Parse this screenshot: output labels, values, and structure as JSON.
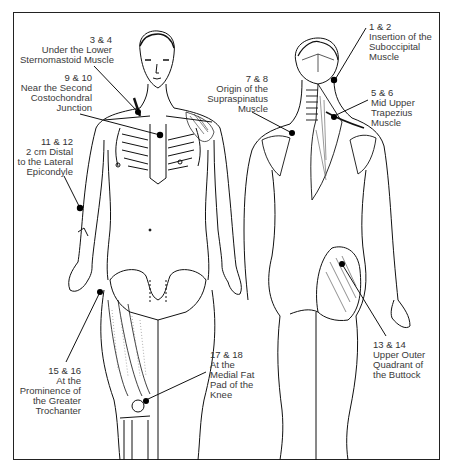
{
  "diagram": {
    "type": "anatomical-tender-points",
    "views": [
      "anterior",
      "posterior"
    ],
    "labels": [
      {
        "id": "p3-4",
        "numbers": "3 & 4",
        "lines": [
          "Under the Lower",
          "Sternomastoid Muscle"
        ]
      },
      {
        "id": "p9-10",
        "numbers": "9 & 10",
        "lines": [
          "Near the Second",
          "Costochondral",
          "Junction"
        ]
      },
      {
        "id": "p11-12",
        "numbers": "11 & 12",
        "lines": [
          "2 cm  Distal",
          "to the Lateral",
          "Epicondyle"
        ]
      },
      {
        "id": "p15-16",
        "numbers": "15 & 16",
        "lines": [
          "At the",
          "Prominence of",
          "the Greater",
          "Trochanter"
        ]
      },
      {
        "id": "p17-18",
        "numbers": "17 & 18",
        "lines": [
          "At the",
          "Medial Fat",
          "Pad of the",
          "Knee"
        ]
      },
      {
        "id": "p1-2",
        "numbers": "1 & 2",
        "lines": [
          "Insertion of the",
          "Suboccipital",
          "Muscle"
        ]
      },
      {
        "id": "p7-8",
        "numbers": "7 & 8",
        "lines": [
          "Origin of the",
          "Supraspinatus",
          "Muscle"
        ]
      },
      {
        "id": "p5-6",
        "numbers": "5 & 6",
        "lines": [
          "Mid Upper",
          "Trapezius",
          "Muscle"
        ]
      },
      {
        "id": "p13-14",
        "numbers": "13 & 14",
        "lines": [
          "Upper Outer",
          "Quadrant of",
          "the Buttock"
        ]
      }
    ]
  }
}
